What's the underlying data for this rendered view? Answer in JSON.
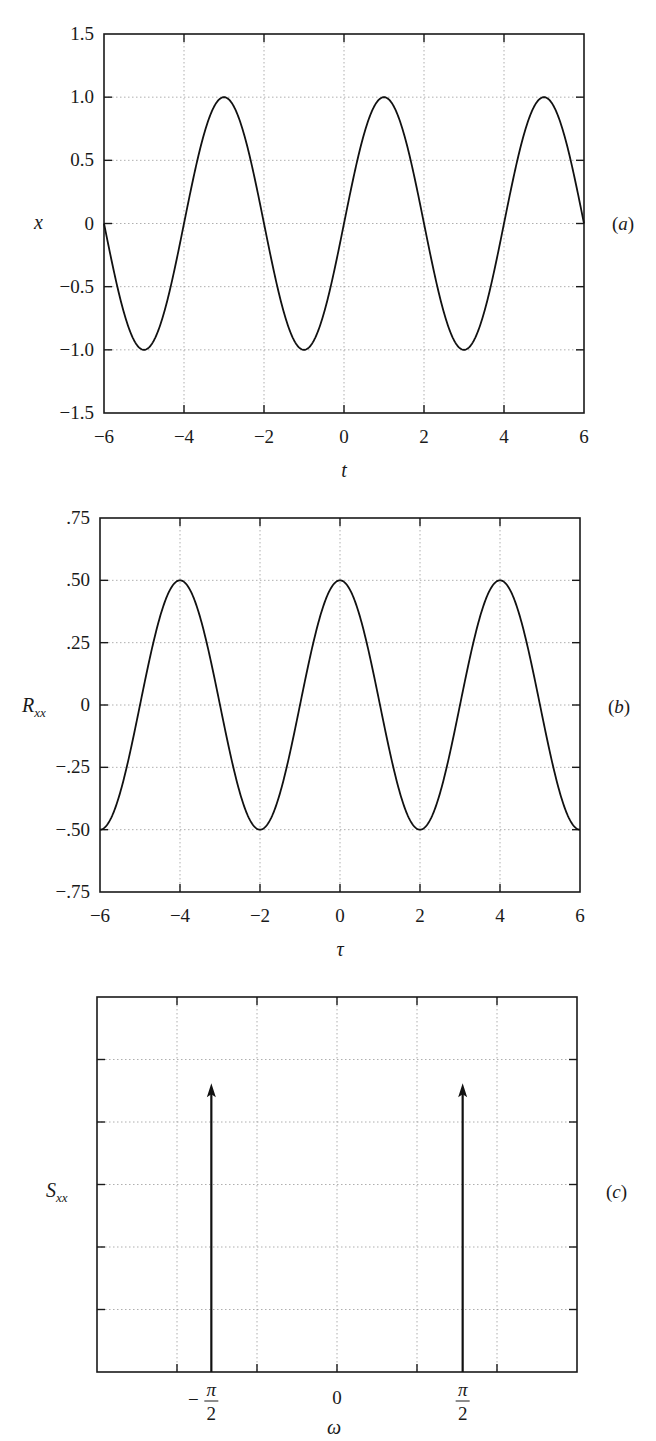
{
  "chart_data": [
    {
      "type": "line",
      "panel_label": "(a)",
      "title": "",
      "xlabel": "t",
      "ylabel": "x",
      "xlim": [
        -6,
        6
      ],
      "ylim": [
        -1.5,
        1.5
      ],
      "xticks": [
        -6,
        -4,
        -2,
        0,
        2,
        4,
        6
      ],
      "xtick_labels": [
        "−6",
        "−4",
        "−2",
        "0",
        "2",
        "4",
        "6"
      ],
      "yticks": [
        1.5,
        1.0,
        0.5,
        0,
        -0.5,
        -1.0,
        -1.5
      ],
      "ytick_labels": [
        "1.5",
        "1.0",
        "0.5",
        "0",
        "−0.5",
        "−1.0",
        "−1.5"
      ],
      "grid": true,
      "function": "x(t) = sin(pi*t/2)",
      "series": [
        {
          "name": "x",
          "x": [
            -6,
            -5,
            -4,
            -3,
            -2,
            -1,
            0,
            1,
            2,
            3,
            4,
            5,
            6
          ],
          "values": [
            0,
            -1,
            0,
            1,
            0,
            -1,
            0,
            1,
            0,
            -1,
            0,
            1,
            0
          ]
        }
      ]
    },
    {
      "type": "line",
      "panel_label": "(b)",
      "title": "",
      "xlabel": "τ",
      "ylabel": "Rxx",
      "ylabel_main": "R",
      "ylabel_sub": "xx",
      "xlim": [
        -6,
        6
      ],
      "ylim": [
        -0.75,
        0.75
      ],
      "xticks": [
        -6,
        -4,
        -2,
        0,
        2,
        4,
        6
      ],
      "xtick_labels": [
        "−6",
        "−4",
        "−2",
        "0",
        "2",
        "4",
        "6"
      ],
      "yticks": [
        0.75,
        0.5,
        0.25,
        0,
        -0.25,
        -0.5,
        -0.75
      ],
      "ytick_labels": [
        ".75",
        ".50",
        ".25",
        "0",
        "−.25",
        "−.50",
        "−.75"
      ],
      "grid": true,
      "function": "Rxx(tau) = 0.5*cos(pi*tau/2)",
      "series": [
        {
          "name": "Rxx",
          "x": [
            -6,
            -5,
            -4,
            -3,
            -2,
            -1,
            0,
            1,
            2,
            3,
            4,
            5,
            6
          ],
          "values": [
            -0.5,
            0,
            0.5,
            0,
            -0.5,
            0,
            0.5,
            0,
            -0.5,
            0,
            0.5,
            0,
            -0.5
          ]
        }
      ]
    },
    {
      "type": "impulse",
      "panel_label": "(c)",
      "title": "",
      "xlabel": "ω",
      "ylabel": "Sxx",
      "ylabel_main": "S",
      "ylabel_sub": "xx",
      "xlim": [
        -3,
        3
      ],
      "x_divisions": 6,
      "y_divisions": 6,
      "xtick_labels": [
        {
          "pos": -1.5708,
          "num": "π",
          "den": "2",
          "sign": "−"
        },
        {
          "pos": 0,
          "text": "0"
        },
        {
          "pos": 1.5708,
          "num": "π",
          "den": "2",
          "sign": ""
        }
      ],
      "ytick_labels": [],
      "grid": true,
      "series": [
        {
          "name": "Sxx impulses",
          "x": [
            -1.5708,
            1.5708
          ],
          "x_labels": [
            "−π/2",
            "π/2"
          ],
          "values": [
            0.5,
            0.5
          ],
          "relative_height": 0.77
        }
      ]
    }
  ]
}
